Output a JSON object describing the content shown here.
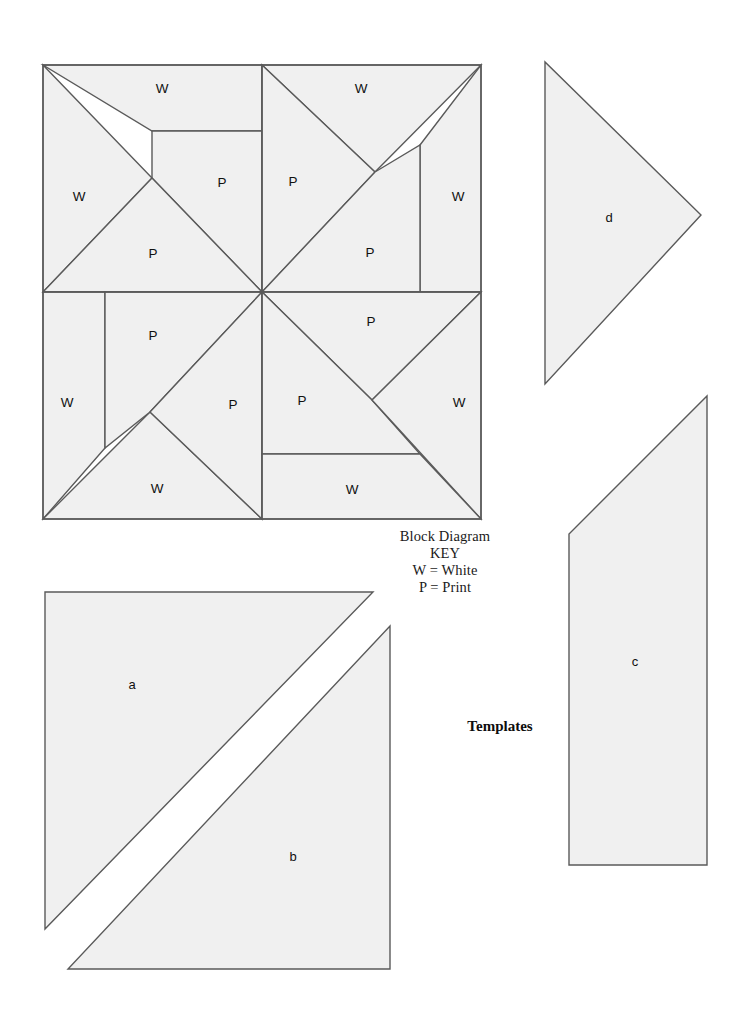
{
  "document": {
    "kind": "quilt-block-diagram-and-templates",
    "background_color": "#ffffff",
    "patch_fill_color": "#f0f0f0",
    "line_color": "#5a5a5a",
    "text_color": "#111111"
  },
  "key": {
    "title": "Block Diagram",
    "heading": "KEY",
    "entries": [
      "W = White",
      "P = Print"
    ]
  },
  "templates_caption": "Templates",
  "block_diagram": {
    "name": "Block Diagram",
    "patch_labels": {
      "top_left": {
        "w_top": "W",
        "w_left": "W",
        "p_right": "P",
        "p_bottom": "P"
      },
      "top_right": {
        "w_top": "W",
        "w_right": "W",
        "p_left": "P",
        "p_bottom": "P"
      },
      "bottom_left": {
        "w_left": "W",
        "w_bottom": "W",
        "p_top": "P",
        "p_right": "P"
      },
      "bottom_right": {
        "w_right": "W",
        "w_bottom": "W",
        "p_top": "P",
        "p_left": "P"
      }
    }
  },
  "templates": [
    {
      "id": "a",
      "label": "a",
      "shape": "right-triangle"
    },
    {
      "id": "b",
      "label": "b",
      "shape": "right-triangle"
    },
    {
      "id": "c",
      "label": "c",
      "shape": "trapezoid"
    },
    {
      "id": "d",
      "label": "d",
      "shape": "right-triangle"
    }
  ]
}
